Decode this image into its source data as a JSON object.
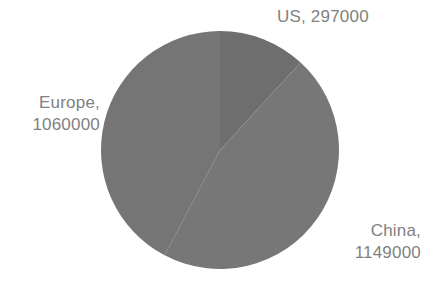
{
  "chart_data": {
    "type": "pie",
    "title": "",
    "categories": [
      "US",
      "China",
      "Europe"
    ],
    "values": [
      297000,
      1149000,
      1060000
    ],
    "total": 2506000,
    "labels": [
      "US, 297000",
      "China, 1149000",
      "Europe, 1060000"
    ],
    "legend": "none",
    "grid": false,
    "start_angle_deg": 0,
    "direction": "clockwise",
    "slice_percentages": [
      11.85,
      45.85,
      42.3
    ],
    "slice_angles_deg": [
      42.7,
      165.0,
      152.3
    ],
    "colors": {
      "us": "#6e6e6e",
      "china": "#777777",
      "europe": "#757575",
      "label_text": "#818181",
      "background": "#ffffff"
    },
    "geometry": {
      "center_x": 220,
      "center_y": 150,
      "radius": 119
    }
  },
  "labels": {
    "us": {
      "name": "US",
      "value": "297000",
      "text": "US, 297000"
    },
    "china": {
      "name": "China",
      "value": "1149000",
      "text": "China,\n1149000"
    },
    "europe": {
      "name": "Europe",
      "value": "1060000",
      "text": "Europe,\n1060000"
    }
  }
}
